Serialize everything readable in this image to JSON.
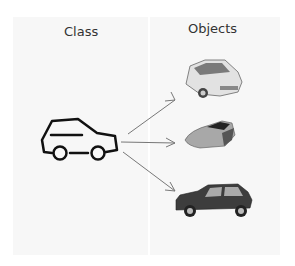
{
  "diagram": {
    "class_label": "Class",
    "objects_label": "Objects",
    "class_icon": "car-outline-icon",
    "objects": [
      {
        "name": "white-hatchback-car",
        "color": "#d9d9d9"
      },
      {
        "name": "silver-sports-car",
        "color": "#9a9a9a"
      },
      {
        "name": "dark-sedan-car",
        "color": "#3a3a3a"
      }
    ],
    "arrow_color": "#777777",
    "panel_color": "#f7f7f7"
  }
}
